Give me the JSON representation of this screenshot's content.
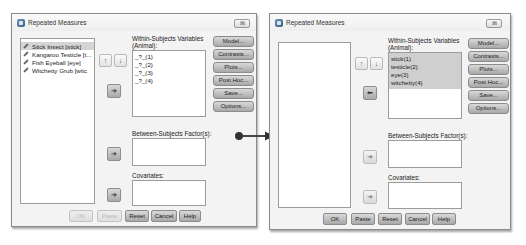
{
  "left_dialog": {
    "title": "Repeated Measures",
    "close_label": "⊠",
    "variables": [
      {
        "label": "Stick Insect [stick]",
        "selected": true
      },
      {
        "label": "Kangaroo Testicle [t...",
        "selected": false
      },
      {
        "label": "Fish Eyeball [eye]",
        "selected": false
      },
      {
        "label": "Witchetty Grub [witc",
        "selected": false
      }
    ],
    "up_arrow": "↑",
    "down_arrow": "↓",
    "move_arrow": "➔",
    "within_label_line1": "Within-Subjects Variables",
    "within_label_line2": "(Animal):",
    "within_items": [
      "_?_(1)",
      "_?_(2)",
      "_?_(3)",
      "_?_(4)"
    ],
    "side_buttons": [
      "Model...",
      "Contrasts...",
      "Plots...",
      "Post Hoc...",
      "Save...",
      "Options..."
    ],
    "between_label": "Between-Subjects Factor(s):",
    "covariates_label": "Covariates:",
    "bottom_buttons": [
      {
        "label": "OK",
        "disabled": true
      },
      {
        "label": "Paste",
        "disabled": true
      },
      {
        "label": "Reset",
        "disabled": false
      },
      {
        "label": "Cancel",
        "disabled": false
      },
      {
        "label": "Help",
        "disabled": false
      }
    ]
  },
  "right_dialog": {
    "title": "Repeated Measures",
    "close_label": "⊠",
    "variables": [],
    "up_arrow": "↑",
    "down_arrow": "↓",
    "move_arrow": "⬅",
    "within_label_line1": "Within-Subjects Variables",
    "within_label_line2": "(Animal):",
    "within_items": [
      "stick(1)",
      "testicle(2)",
      "eye(3)",
      "witchetty(4)"
    ],
    "side_buttons": [
      "Model...",
      "Contrasts...",
      "Plots...",
      "Post Hoc...",
      "Save...",
      "Options..."
    ],
    "between_label": "Between-Subjects Factor(s):",
    "covariates_label": "Covariates:",
    "bottom_buttons": [
      {
        "label": "OK",
        "disabled": false
      },
      {
        "label": "Paste",
        "disabled": false
      },
      {
        "label": "Reset",
        "disabled": false
      },
      {
        "label": "Cancel",
        "disabled": false
      },
      {
        "label": "Help",
        "disabled": false
      }
    ]
  },
  "colors": {
    "dialog_bg": "#f3f3f3",
    "button_dark": "#a8a8a8",
    "selection": "#d4d4d4",
    "connector": "#333333"
  }
}
